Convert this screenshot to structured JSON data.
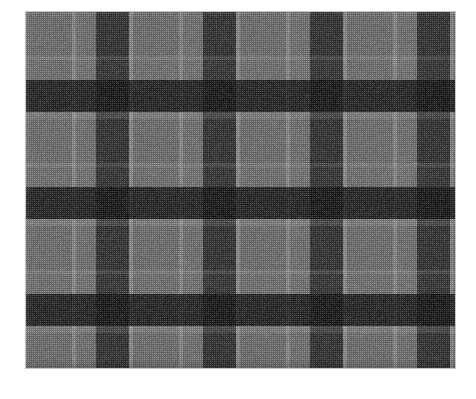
{
  "image": {
    "subject": "tartan-plaid-woven-fabric-swatch",
    "description": "Grey black and charcoal check plaid woven fabric swatch photographed flat on a white background",
    "alt_text": "Grey and black tartan plaid fabric",
    "background_color": "#ffffff"
  },
  "swatch": {
    "left": 26,
    "top": 12,
    "width": 429,
    "height": 356,
    "edge_color": "#9a9a9a"
  },
  "palette": {
    "base_grey": "#6e6e6e",
    "light_grey": "#7c7c7c",
    "pale_stripe": "#8a8a8a",
    "mid_grey": "#636363",
    "dark_charcoal": "#2b2b2b",
    "deep_charcoal": "#242424",
    "black": "#0d0d0d",
    "near_black": "#141414"
  },
  "pattern": {
    "type": "tartan-check",
    "repeat_width": 107,
    "repeat_height": 107,
    "warp_stripes": [
      {
        "name": "ground-light",
        "offset": 0,
        "width": 46,
        "color": "#6e6e6e"
      },
      {
        "name": "pale-accent",
        "offset": 46,
        "width": 4,
        "color": "#8a8a8a"
      },
      {
        "name": "ground-light-2",
        "offset": 50,
        "width": 20,
        "color": "#717171"
      },
      {
        "name": "dark-bar",
        "offset": 70,
        "width": 33,
        "color": "#2b2b2b"
      },
      {
        "name": "pale-edge",
        "offset": 103,
        "width": 4,
        "color": "#8d8d8d"
      }
    ],
    "weft_stripes": [
      {
        "name": "ground-light",
        "offset": 0,
        "height": 44,
        "color": "#6e6e6e"
      },
      {
        "name": "pale-accent",
        "offset": 44,
        "height": 4,
        "color": "#888888"
      },
      {
        "name": "ground-light-2",
        "offset": 48,
        "height": 20,
        "color": "#727272"
      },
      {
        "name": "dark-bar",
        "offset": 68,
        "height": 32,
        "color": "#2e2e2e"
      },
      {
        "name": "pale-edge",
        "offset": 100,
        "height": 7,
        "color": "#8b8b8b"
      }
    ],
    "intersection_color": "#0d0d0d",
    "weave_texture": "plain-weave-1px-crosshatch"
  }
}
